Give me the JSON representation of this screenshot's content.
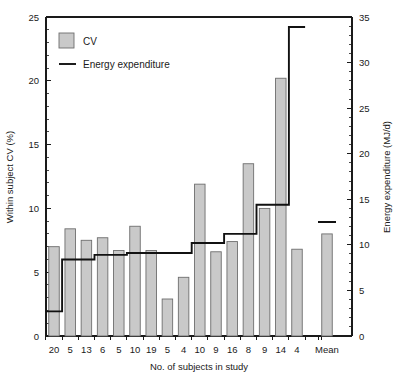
{
  "chart_data": {
    "type": "bar",
    "title": "",
    "xlabel": "No. of subjects in study",
    "ylabel": "Within subject CV (%)",
    "y2label": "Energy expenditure (MJ/d)",
    "categories": [
      "20",
      "5",
      "13",
      "6",
      "5",
      "10",
      "19",
      "5",
      "4",
      "10",
      "9",
      "16",
      "8",
      "9",
      "14",
      "4",
      "Mean"
    ],
    "ylim": [
      0,
      25
    ],
    "yticks": [
      0,
      5,
      10,
      15,
      20,
      25
    ],
    "y2lim": [
      0,
      35
    ],
    "y2ticks": [
      0,
      5,
      10,
      15,
      20,
      25,
      30,
      35
    ],
    "grid": false,
    "legend_position": "top-left",
    "series": [
      {
        "name": "CV",
        "type": "bar",
        "unit": "%",
        "axis": "left",
        "values": [
          7.0,
          8.4,
          7.5,
          7.7,
          6.7,
          8.6,
          6.7,
          2.9,
          4.6,
          11.9,
          6.6,
          7.4,
          13.5,
          10.0,
          20.2,
          6.8,
          8.0
        ]
      },
      {
        "name": "Energy expenditure",
        "type": "step-line",
        "unit": "MJ/d",
        "axis": "right",
        "values": [
          2.7,
          8.4,
          8.4,
          8.9,
          8.9,
          9.1,
          9.1,
          9.1,
          9.1,
          10.2,
          10.2,
          11.2,
          11.2,
          14.4,
          14.4,
          33.9,
          12.5
        ]
      }
    ],
    "legend": [
      {
        "label": "CV",
        "marker": "filled-square",
        "color": "#c9c9c9"
      },
      {
        "label": "Energy expenditure",
        "marker": "line",
        "color": "#111111"
      }
    ]
  },
  "axes": {
    "left_title": "Within subject CV (%)",
    "right_title": "Energy expenditure (MJ/d)",
    "bottom_title": "No. of subjects in study",
    "left_ticks": [
      "0",
      "5",
      "10",
      "15",
      "20",
      "25"
    ],
    "right_ticks": [
      "0",
      "5",
      "10",
      "15",
      "20",
      "25",
      "30",
      "35"
    ],
    "bottom_ticks": [
      "20",
      "5",
      "13",
      "6",
      "5",
      "10",
      "19",
      "5",
      "4",
      "10",
      "9",
      "16",
      "8",
      "9",
      "14",
      "4",
      "Mean"
    ]
  }
}
